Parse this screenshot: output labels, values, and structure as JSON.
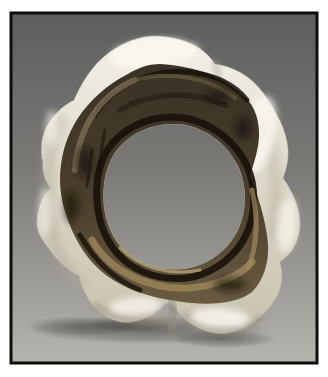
{
  "palette": {
    "white_margin": "#ffffff",
    "border": "#0e0e0d",
    "bg_top": "#5e5e5d",
    "bg_mid": "#7b7a77",
    "bg_bottom": "#b6b4ae",
    "glaze_highlight": "#f9f7f0",
    "glaze_top": "#f3f1e8",
    "glaze_mid": "#d9d4c4",
    "glaze_bottom": "#c8c2b0",
    "glaze_shadow": "#b2ac9b",
    "glaze_crease": "#8f8a7b",
    "band_top": "#3a3226",
    "band_mid": "#4a3e2c",
    "band_bottom": "#6a5c42",
    "band_dark": "#18120a",
    "band_olive": "#2a2316",
    "band_tan": "#7d6e52",
    "band_bronze": "#a18a5e",
    "band_bronze_bright": "#b6a274",
    "ground_shadow": "#35332e"
  }
}
